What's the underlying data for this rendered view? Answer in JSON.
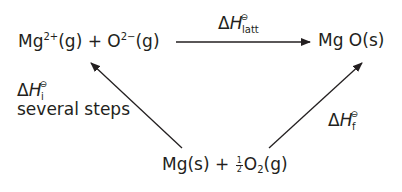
{
  "diagram": {
    "type": "born-haber-cycle",
    "nodes": {
      "gaseous_ions": {
        "base1": "Mg",
        "sup1": "2+",
        "mid": "(g) + O",
        "sup2": "2−",
        "end": "(g)"
      },
      "product": {
        "text": "Mg O(s)"
      },
      "elements": {
        "part1": "Mg(s) + ",
        "frac_num": "1",
        "frac_den": "2",
        "part2": "O",
        "sub": "2",
        "part3": "(g)"
      }
    },
    "edges": {
      "lattice": {
        "delta": "Δ",
        "symbol": "H",
        "std": "⊖",
        "sub": "latt"
      },
      "ionisation": {
        "delta": "Δ",
        "symbol": "H",
        "std": "⊖",
        "sub": "i",
        "note": "several steps"
      },
      "formation": {
        "delta": "Δ",
        "symbol": "H",
        "std": "⊖",
        "sub": "f"
      }
    },
    "colors": {
      "ink": "#231f20",
      "background": "#ffffff"
    }
  }
}
